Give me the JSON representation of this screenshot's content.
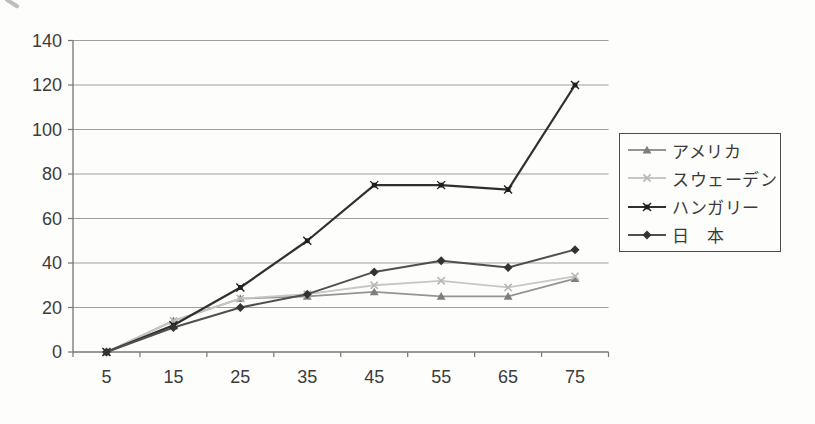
{
  "chart_data": {
    "type": "line",
    "title": "",
    "xlabel": "",
    "ylabel": "",
    "categories": [
      5,
      15,
      25,
      35,
      45,
      55,
      65,
      75
    ],
    "series": [
      {
        "name": "アメリカ",
        "marker": "triangle",
        "color": "#949494",
        "marker_color": "#7e7e7e",
        "values": [
          0,
          14,
          24,
          25,
          27,
          25,
          25,
          33
        ]
      },
      {
        "name": "スウェーデン",
        "marker": "x",
        "color": "#c7c7c7",
        "marker_color": "#b8b8b8",
        "values": [
          0,
          14,
          24,
          26,
          30,
          32,
          29,
          34
        ]
      },
      {
        "name": "ハンガリー",
        "marker": "asterisk",
        "color": "#2f2f2f",
        "marker_color": "#1f1f1f",
        "values": [
          0,
          12,
          29,
          50,
          75,
          75,
          73,
          120
        ]
      },
      {
        "name": "日　本",
        "marker": "diamond",
        "color": "#4f4f4f",
        "marker_color": "#333333",
        "values": [
          0,
          11,
          20,
          26,
          36,
          41,
          38,
          46
        ]
      }
    ],
    "ylim": [
      0,
      140
    ],
    "y_ticks": [
      0,
      20,
      40,
      60,
      80,
      100,
      120,
      140
    ],
    "grid": true,
    "legend_position": "right",
    "colors": {
      "gridline": "#9f9f9f",
      "axis": "#767676",
      "tick_label": "#3c3c3c",
      "legend_border": "#4a4a4a",
      "background": "#fdfdfb"
    }
  }
}
